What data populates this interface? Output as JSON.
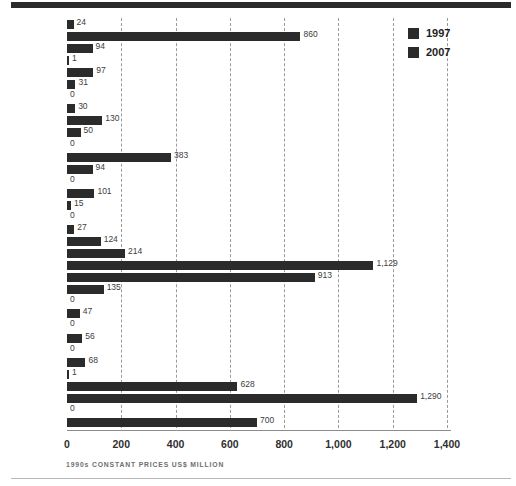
{
  "chart_data": {
    "type": "bar",
    "orientation": "horizontal",
    "title": "",
    "subtitle": "",
    "xlabel": "1990s CONSTANT PRICES US$ MILLION",
    "ylabel": "",
    "xlim": [
      0,
      1400
    ],
    "xticks": [
      0,
      200,
      400,
      600,
      800,
      1000,
      1200,
      1400
    ],
    "xtick_labels": [
      "0",
      "200",
      "400",
      "600",
      "800",
      "1,000",
      "1,200",
      "1,400"
    ],
    "grid": true,
    "grid_axis": "x",
    "grid_style": "dashed",
    "legend_position": "top-right",
    "categories": [
      "Venezuela",
      "Vietnam",
      "UAE",
      "Syria",
      "South Korea",
      "Malaysia",
      "Kuwait",
      "Kazakhstan",
      "Iraq",
      "Iran",
      "India",
      "Egypt",
      "Ecuador",
      "Cyprus",
      "Colombia",
      "China",
      "Algeria"
    ],
    "series": [
      {
        "name": "1997",
        "color": "#2b2b2b",
        "values": [
          24,
          94,
          97,
          0,
          130,
          0,
          94,
          101,
          0,
          124,
          1129,
          135,
          47,
          56,
          68,
          628,
          0
        ],
        "labels": [
          "24",
          "94",
          "97",
          "0",
          "130",
          "0",
          "94",
          "101",
          "0",
          "124",
          "1,129",
          "135",
          "47",
          "56",
          "68",
          "628",
          "0"
        ]
      },
      {
        "name": "2007",
        "color": "#2b2b2b",
        "values": [
          860,
          1,
          31,
          30,
          50,
          383,
          0,
          15,
          27,
          214,
          913,
          0,
          0,
          0,
          1,
          1290,
          700
        ],
        "labels": [
          "860",
          "1",
          "31",
          "30",
          "50",
          "383",
          "0",
          "15",
          "27",
          "214",
          "913",
          "0",
          "0",
          "0",
          "1",
          "1,290",
          "700"
        ]
      }
    ]
  },
  "legend": {
    "items": [
      {
        "label": "1997",
        "color": "#2b2b2b"
      },
      {
        "label": "2007",
        "color": "#2b2b2b"
      }
    ]
  },
  "axis_caption": "1990s CONSTANT PRICES US$ MILLION",
  "colors": {
    "bar": "#2b2b2b",
    "grid": "#9a9a9a",
    "axis": "#8d8d8d",
    "rule": "#2b2b2b",
    "label": "#3a3a3a"
  }
}
